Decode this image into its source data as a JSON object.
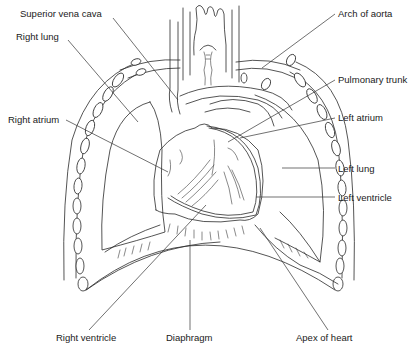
{
  "figure": {
    "labels": {
      "superior_vena_cava": "Superior vena cava",
      "right_lung": "Right lung",
      "right_atrium": "Right atrium",
      "arch_of_aorta": "Arch of aorta",
      "pulmonary_trunk": "Pulmonary trunk",
      "left_atrium": "Left atrium",
      "left_lung": "Left lung",
      "left_ventricle": "Left ventricle",
      "right_ventricle": "Right ventricle",
      "diaphragm": "Diaphragm",
      "apex_of_heart": "Apex of heart"
    },
    "colors": {
      "background": "#ffffff",
      "line": "#2a2a2a",
      "text": "#1a1a1a"
    }
  }
}
